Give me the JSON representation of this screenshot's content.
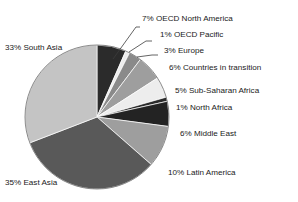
{
  "chart_data": {
    "type": "pie",
    "title": "",
    "subtitle": "",
    "xlabel": "",
    "ylabel": "",
    "legend_position": "callout-labels",
    "grid": false,
    "value_unit": "percent",
    "total_labeled_percent": 107,
    "categories": [
      "OECD North America",
      "OECD Pacific",
      "Europe",
      "Countries in transition",
      "Sub-Saharan Africa",
      "North Africa",
      "Middle East",
      "Latin America",
      "East Asia",
      "South Asia"
    ],
    "values": [
      7,
      1,
      3,
      6,
      5,
      1,
      6,
      10,
      35,
      33
    ],
    "labels": [
      "7% OECD North America",
      "1% OECD Pacific",
      "3% Europe",
      "6% Countries in transition",
      "5% Sub-Saharan Africa",
      "1% North Africa",
      "6% Middle East",
      "10% Latin America",
      "35% East Asia",
      "33% South Asia"
    ],
    "slice_colors": [
      "#2b2b2b",
      "#ededed",
      "#8a8a8a",
      "#9e9e9e",
      "#ededed",
      "#2b2b2b",
      "#232323",
      "#9e9e9e",
      "#595959",
      "#c4c4c4"
    ]
  },
  "geometry": {
    "center_x": 97,
    "center_y": 117,
    "radius": 72,
    "start_angle_deg": 0,
    "direction": "clockwise"
  },
  "colors": {
    "background": "#ffffff",
    "text": "#1a1a1a",
    "leader_line": "#3c3c3c",
    "pie_outline": "#6e6e6e"
  },
  "callouts": [
    {
      "text": "7% OECD North America",
      "x": 142,
      "y": 21,
      "anchor": "start"
    },
    {
      "text": "1% OECD Pacific",
      "x": 160,
      "y": 37,
      "anchor": "start"
    },
    {
      "text": "3% Europe",
      "x": 164,
      "y": 53,
      "anchor": "start"
    },
    {
      "text": "6% Countries in transition",
      "x": 169,
      "y": 70,
      "anchor": "start"
    },
    {
      "text": "5% Sub-Saharan Africa",
      "x": 175,
      "y": 93,
      "anchor": "start"
    },
    {
      "text": "1% North Africa",
      "x": 176,
      "y": 110,
      "anchor": "start"
    },
    {
      "text": "6% Middle East",
      "x": 180,
      "y": 136,
      "anchor": "start"
    },
    {
      "text": "10% Latin America",
      "x": 168,
      "y": 175,
      "anchor": "start"
    },
    {
      "text": "33% South Asia",
      "x": 5,
      "y": 50,
      "anchor": "start"
    },
    {
      "text": "35% East Asia",
      "x": 5,
      "y": 185,
      "anchor": "start"
    }
  ]
}
